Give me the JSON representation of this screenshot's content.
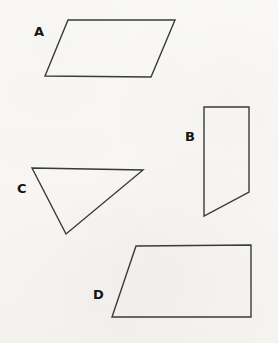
{
  "figure": {
    "width": 278,
    "height": 343,
    "background_color": "#f7f6f3",
    "stroke_color": "#3a3a3a",
    "label_color": "#151515",
    "stroke_width": 1.4
  },
  "shapes": [
    {
      "label": "A",
      "kind": "parallelogram",
      "points": "68,20 175,20 151,77 45,76",
      "label_position": {
        "x": 34,
        "y": 25
      },
      "vertices": [
        {
          "x": 68,
          "y": 20
        },
        {
          "x": 175,
          "y": 20
        },
        {
          "x": 151,
          "y": 77
        },
        {
          "x": 45,
          "y": 76
        }
      ]
    },
    {
      "label": "B",
      "kind": "trapezoid",
      "points": "204,107 249,107 249,192 204,216",
      "label_position": {
        "x": 185,
        "y": 130
      },
      "vertices": [
        {
          "x": 204,
          "y": 107
        },
        {
          "x": 249,
          "y": 107
        },
        {
          "x": 249,
          "y": 192
        },
        {
          "x": 204,
          "y": 216
        }
      ]
    },
    {
      "label": "C",
      "kind": "triangle",
      "points": "32,168 143,170 66,234",
      "label_position": {
        "x": 17,
        "y": 182
      },
      "vertices": [
        {
          "x": 32,
          "y": 168
        },
        {
          "x": 143,
          "y": 170
        },
        {
          "x": 66,
          "y": 234
        }
      ]
    },
    {
      "label": "D",
      "kind": "right-trapezoid",
      "points": "136,246 251,245 251,317 112,317",
      "label_position": {
        "x": 93,
        "y": 288
      },
      "vertices": [
        {
          "x": 136,
          "y": 246
        },
        {
          "x": 251,
          "y": 245
        },
        {
          "x": 251,
          "y": 317
        },
        {
          "x": 112,
          "y": 317
        }
      ]
    }
  ]
}
